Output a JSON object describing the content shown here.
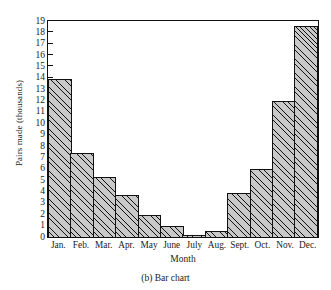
{
  "caption": "(b)  Bar chart",
  "chart_data": {
    "type": "bar",
    "title": "",
    "xlabel": "Month",
    "ylabel": "Pairs made (thousands)",
    "categories": [
      "Jan.",
      "Feb.",
      "Mar.",
      "Apr.",
      "May",
      "June",
      "July",
      "Aug.",
      "Sept.",
      "Oct.",
      "Nov.",
      "Dec."
    ],
    "values": [
      13.9,
      7.4,
      5.3,
      3.7,
      1.9,
      1.0,
      0.2,
      0.5,
      3.9,
      6.0,
      12.0,
      18.6
    ],
    "ylim": [
      0,
      19
    ],
    "yticks": [
      0,
      1,
      2,
      3,
      4,
      5,
      6,
      7,
      8,
      9,
      10,
      11,
      12,
      13,
      14,
      15,
      16,
      17,
      18,
      19
    ],
    "ytick_labels": [
      "0",
      "1",
      "2",
      "3",
      "4",
      "5",
      "6",
      "7",
      "8",
      "9",
      "10",
      "11",
      "12",
      "13",
      "14",
      "15",
      "16",
      "17",
      "18",
      "19"
    ],
    "grid": false,
    "legend": null,
    "bar_fill": "#c9c9c9",
    "bar_hatch": "diagonal-45",
    "bar_edge_color": "#111111",
    "axis_color": "#111111",
    "background": "#ffffff"
  }
}
